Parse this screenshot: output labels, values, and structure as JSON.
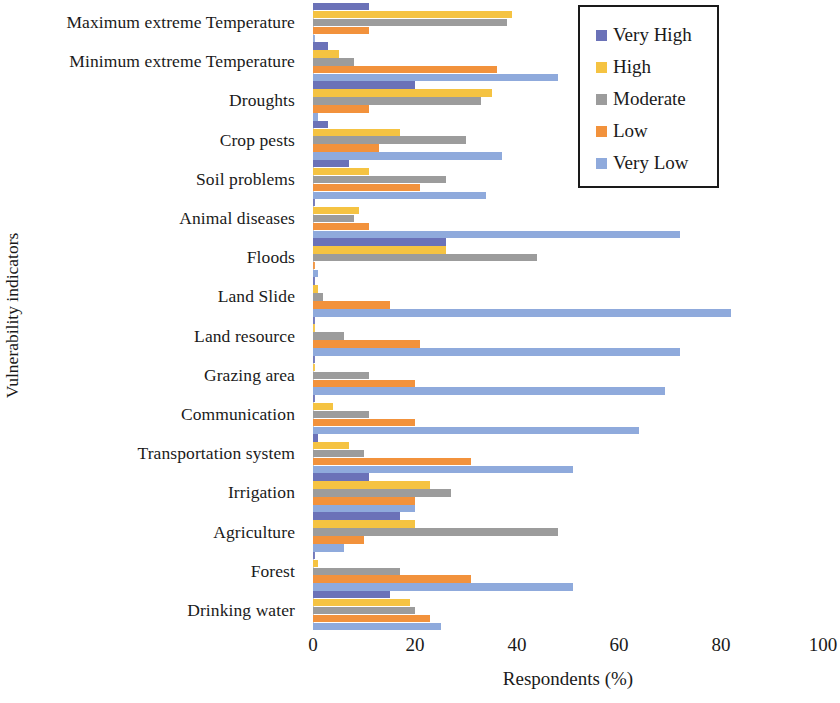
{
  "chart_data": {
    "type": "bar",
    "orientation": "horizontal",
    "title": "",
    "xlabel": "Respondents (%)",
    "ylabel": "Vulnerability indicators",
    "xlim": [
      0,
      100
    ],
    "xticks": [
      0,
      20,
      40,
      60,
      80,
      100
    ],
    "grid": false,
    "legend_position": "top-right",
    "categories": [
      "Maximum extreme Temperature",
      "Minimum extreme Temperature",
      "Droughts",
      "Crop pests",
      "Soil problems",
      "Animal diseases",
      "Floods",
      "Land Slide",
      "Land resource",
      "Grazing area",
      "Communication",
      "Transportation system",
      "Irrigation",
      "Agriculture",
      "Forest",
      "Drinking water"
    ],
    "series": [
      {
        "name": "Very High",
        "color": "#6B72B8",
        "values": [
          11,
          3,
          20,
          3,
          7,
          0,
          26,
          0,
          0,
          0,
          0,
          1,
          11,
          17,
          0,
          15
        ]
      },
      {
        "name": "High",
        "color": "#F5C342",
        "values": [
          39,
          5,
          35,
          17,
          11,
          9,
          26,
          1,
          0,
          0,
          4,
          7,
          23,
          20,
          1,
          19
        ]
      },
      {
        "name": "Moderate",
        "color": "#9C9C9C",
        "values": [
          38,
          8,
          33,
          30,
          26,
          8,
          44,
          2,
          6,
          11,
          11,
          10,
          27,
          48,
          17,
          20
        ]
      },
      {
        "name": "Low",
        "color": "#F2923C",
        "values": [
          11,
          36,
          11,
          13,
          21,
          11,
          0,
          15,
          21,
          20,
          20,
          31,
          20,
          10,
          31,
          23
        ]
      },
      {
        "name": "Very Low",
        "color": "#8FAADC",
        "values": [
          0,
          48,
          1,
          37,
          34,
          72,
          1,
          82,
          72,
          69,
          64,
          51,
          20,
          6,
          51,
          25
        ]
      }
    ]
  },
  "legend": {
    "items": [
      {
        "label": "Very High",
        "color": "#6B72B8"
      },
      {
        "label": "High",
        "color": "#F5C342"
      },
      {
        "label": "Moderate",
        "color": "#9C9C9C"
      },
      {
        "label": "Low",
        "color": "#F2923C"
      },
      {
        "label": "Very Low",
        "color": "#8FAADC"
      }
    ]
  }
}
